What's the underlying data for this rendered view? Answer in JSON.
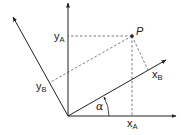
{
  "diagram": {
    "colors": {
      "line": "#222222",
      "dashed": "#444444",
      "background": "#ffffff"
    },
    "origin": {
      "x": 68,
      "y": 116
    },
    "axes": {
      "xA": {
        "label": "x",
        "subscript": "A",
        "tip": {
          "x": 176,
          "y": 116
        }
      },
      "yA": {
        "label": "y",
        "subscript": "A",
        "tip": {
          "x": 68,
          "y": 3
        }
      },
      "xB": {
        "label": "x",
        "subscript": "B",
        "tip": {
          "x": 166,
          "y": 60
        }
      },
      "yB": {
        "label": "y",
        "subscript": "B",
        "tip": {
          "x": 13,
          "y": 17
        }
      }
    },
    "point": {
      "label": "P",
      "x": 132,
      "y": 36
    },
    "angle": {
      "label": "α"
    },
    "labels": {
      "yA_main": "y",
      "yA_sub": "A",
      "xA_main": "x",
      "xA_sub": "A",
      "xB_main": "x",
      "xB_sub": "B",
      "yB_main": "y",
      "yB_sub": "B",
      "P": "P",
      "alpha": "α"
    }
  }
}
